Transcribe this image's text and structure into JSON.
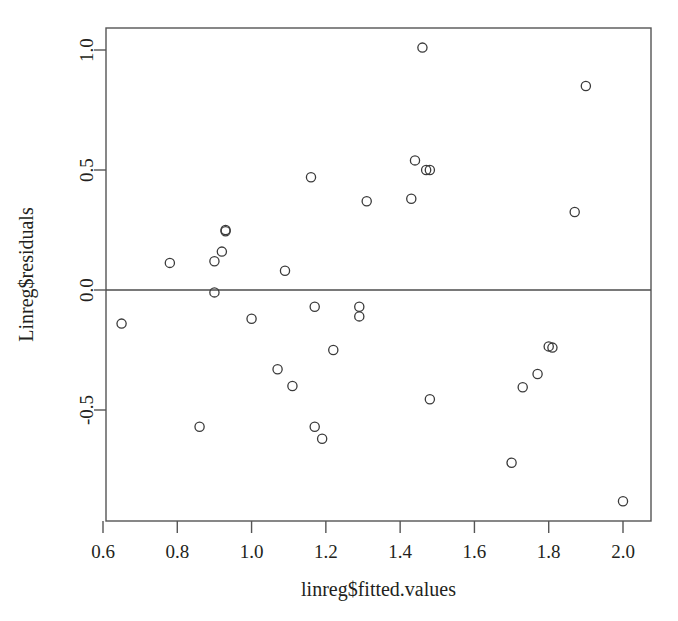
{
  "figure": {
    "background_color": "#ffffff",
    "point_color": "#3a3a3a",
    "axis_color": "#555555",
    "text_color": "#231f20"
  },
  "axes": {
    "x_title": "linreg$fitted.values",
    "y_title": "Linreg$residuals",
    "x_ticks": [
      "0.6",
      "0.8",
      "1.0",
      "1.2",
      "1.4",
      "1.6",
      "1.8",
      "2.0"
    ],
    "y_ticks": [
      "-0.5",
      "0.0",
      "0.5",
      "1.0"
    ]
  },
  "chart_data": {
    "type": "scatter",
    "title": "",
    "xlabel": "linreg$fitted.values",
    "ylabel": "Linreg$residuals",
    "xlim": [
      0.58,
      2.04
    ],
    "ylim": [
      -0.93,
      1.1
    ],
    "xticks": [
      0.6,
      0.8,
      1.0,
      1.2,
      1.4,
      1.6,
      1.8,
      2.0
    ],
    "yticks": [
      -0.5,
      0.0,
      0.5,
      1.0
    ],
    "grid": false,
    "legend": false,
    "marker": "open-circle",
    "reference_lines": [
      {
        "orientation": "horizontal",
        "y": 0.0
      }
    ],
    "series": [
      {
        "name": "residuals",
        "x": [
          0.65,
          0.78,
          0.86,
          0.9,
          0.9,
          0.92,
          0.93,
          0.93,
          1.0,
          1.07,
          1.09,
          1.11,
          1.16,
          1.17,
          1.17,
          1.19,
          1.22,
          1.29,
          1.29,
          1.31,
          1.43,
          1.44,
          1.46,
          1.47,
          1.48,
          1.48,
          1.7,
          1.73,
          1.77,
          1.8,
          1.81,
          1.87,
          1.9,
          2.0
        ],
        "y": [
          -0.14,
          0.113,
          -0.57,
          0.12,
          -0.01,
          0.16,
          0.245,
          0.25,
          -0.12,
          -0.33,
          0.08,
          -0.4,
          0.47,
          -0.07,
          -0.57,
          -0.62,
          -0.25,
          -0.07,
          -0.11,
          0.37,
          0.38,
          0.54,
          1.01,
          0.5,
          0.5,
          -0.455,
          -0.72,
          -0.405,
          -0.35,
          -0.235,
          -0.24,
          0.325,
          0.85,
          -0.88
        ]
      }
    ]
  }
}
